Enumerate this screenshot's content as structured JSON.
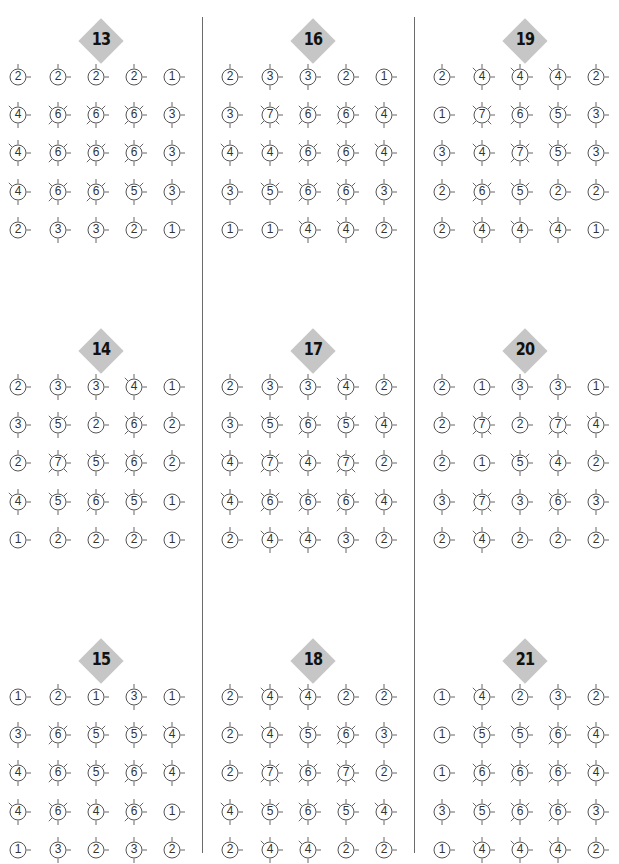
{
  "page": {
    "puzzles": [
      {
        "number": "13",
        "grid": [
          [
            2,
            2,
            2,
            2,
            1
          ],
          [
            4,
            6,
            6,
            6,
            3
          ],
          [
            4,
            6,
            6,
            6,
            3
          ],
          [
            4,
            6,
            6,
            5,
            3
          ],
          [
            2,
            3,
            3,
            2,
            1
          ]
        ]
      },
      {
        "number": "16",
        "grid": [
          [
            2,
            3,
            3,
            2,
            1
          ],
          [
            3,
            7,
            6,
            6,
            4
          ],
          [
            4,
            4,
            6,
            6,
            4
          ],
          [
            3,
            5,
            6,
            6,
            3
          ],
          [
            1,
            1,
            4,
            4,
            2
          ]
        ]
      },
      {
        "number": "19",
        "grid": [
          [
            2,
            4,
            4,
            4,
            2
          ],
          [
            1,
            7,
            6,
            5,
            3
          ],
          [
            3,
            4,
            7,
            5,
            3
          ],
          [
            2,
            6,
            5,
            2,
            2
          ],
          [
            2,
            4,
            4,
            4,
            1
          ]
        ]
      },
      {
        "number": "14",
        "grid": [
          [
            2,
            3,
            3,
            4,
            1
          ],
          [
            3,
            5,
            2,
            6,
            2
          ],
          [
            2,
            7,
            5,
            6,
            2
          ],
          [
            4,
            5,
            6,
            5,
            1
          ],
          [
            1,
            2,
            2,
            2,
            1
          ]
        ]
      },
      {
        "number": "17",
        "grid": [
          [
            2,
            3,
            3,
            4,
            2
          ],
          [
            3,
            5,
            6,
            5,
            4
          ],
          [
            4,
            7,
            4,
            7,
            2
          ],
          [
            4,
            6,
            6,
            6,
            4
          ],
          [
            2,
            4,
            4,
            3,
            2
          ]
        ]
      },
      {
        "number": "20",
        "grid": [
          [
            2,
            1,
            3,
            3,
            1
          ],
          [
            2,
            7,
            2,
            7,
            4
          ],
          [
            2,
            1,
            5,
            4,
            2
          ],
          [
            3,
            7,
            3,
            6,
            3
          ],
          [
            2,
            4,
            2,
            2,
            2
          ]
        ]
      },
      {
        "number": "15",
        "grid": [
          [
            1,
            2,
            1,
            3,
            1
          ],
          [
            3,
            6,
            5,
            5,
            4
          ],
          [
            4,
            6,
            5,
            6,
            4
          ],
          [
            4,
            6,
            4,
            6,
            1
          ],
          [
            1,
            3,
            2,
            3,
            2
          ]
        ]
      },
      {
        "number": "18",
        "grid": [
          [
            2,
            4,
            4,
            2,
            2
          ],
          [
            2,
            4,
            5,
            6,
            3
          ],
          [
            2,
            7,
            6,
            7,
            2
          ],
          [
            4,
            5,
            6,
            5,
            4
          ],
          [
            2,
            4,
            4,
            2,
            2
          ]
        ]
      },
      {
        "number": "21",
        "grid": [
          [
            1,
            4,
            2,
            3,
            2
          ],
          [
            1,
            5,
            5,
            6,
            4
          ],
          [
            1,
            6,
            6,
            6,
            4
          ],
          [
            3,
            5,
            6,
            6,
            3
          ],
          [
            1,
            4,
            4,
            4,
            2
          ]
        ]
      }
    ],
    "colors": {
      "badge": "#c6c6c6",
      "badge_text": "#111111",
      "stroke": "#555555",
      "divider": "#6a6a6a"
    }
  }
}
